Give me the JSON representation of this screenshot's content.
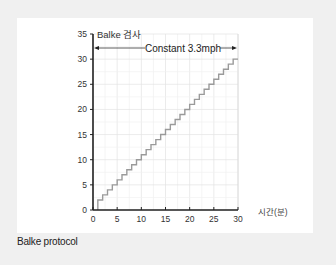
{
  "chart_data": {
    "type": "line",
    "title": "Balke 검사",
    "annotation": "Constant 3.3mph",
    "xlabel": "시간(분)",
    "ylabel": "",
    "xlim": [
      0,
      30
    ],
    "ylim": [
      0,
      35
    ],
    "x_ticks": [
      0,
      5,
      10,
      15,
      20,
      25,
      30
    ],
    "y_ticks": [
      0,
      5,
      10,
      15,
      20,
      25,
      30,
      35
    ],
    "grid": true,
    "legend": null,
    "series": [
      {
        "name": "Balke protocol grade",
        "step": true,
        "x": [
          1,
          2,
          3,
          4,
          5,
          6,
          7,
          8,
          9,
          10,
          11,
          12,
          13,
          14,
          15,
          16,
          17,
          18,
          19,
          20,
          21,
          22,
          23,
          24,
          25,
          26,
          27,
          28,
          29,
          30
        ],
        "values": [
          2,
          3,
          4,
          5,
          6,
          7,
          8,
          9,
          10,
          11,
          12,
          13,
          14,
          15,
          16,
          17,
          18,
          19,
          20,
          21,
          22,
          23,
          24,
          25,
          26,
          27,
          28,
          29,
          30,
          30
        ]
      }
    ],
    "colors": {
      "line": "#9a9a9a",
      "axis": "#222222",
      "grid": "#e6e6e6"
    }
  },
  "caption": "Balke protocol"
}
